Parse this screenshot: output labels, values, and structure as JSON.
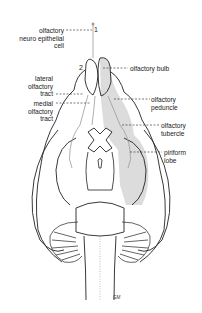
{
  "figure": {
    "type": "anatomical line drawing",
    "view": "ventral view of brain",
    "colors": {
      "line": "#222222",
      "shade": "#dcdcdc",
      "pathway": "#9a9a9a",
      "background": "#ffffff"
    }
  },
  "markers": {
    "one": "1",
    "two": "2"
  },
  "labels": {
    "neuro_epithelial": {
      "line1": "olfactory",
      "line2": "neuro epithelial",
      "line3": "cell"
    },
    "olfactory_bulb": {
      "line1": "olfactory bulb"
    },
    "lateral_tract": {
      "line1": "lateral",
      "line2": "olfactory",
      "line3": "tract"
    },
    "medial_tract": {
      "line1": "medial",
      "line2": "olfactory",
      "line3": "tract"
    },
    "peduncle": {
      "line1": "olfactory",
      "line2": "peduncle"
    },
    "tubercle": {
      "line1": "olfactory",
      "line2": "tubercle"
    },
    "piriform": {
      "line1": "piriform",
      "line2": "lobe"
    }
  },
  "signature": "GM"
}
